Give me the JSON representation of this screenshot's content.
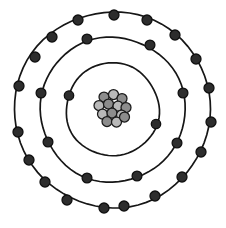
{
  "figure": {
    "name": "bohr-model-atom-diagram",
    "background_color": "#ffffff",
    "width": 226,
    "height": 228,
    "center": {
      "x": 112.5,
      "y": 109.5
    }
  },
  "colors": {
    "shell_stroke": "#161616",
    "electron_fill": "#2d2d2d",
    "electron_stroke": "#101010",
    "proton_fill": "#b9b9b9",
    "neutron_fill": "#8c8c8c",
    "nucleon_stroke": "#1a1a1a"
  },
  "nucleus": {
    "label": "nucleus",
    "nucleon_radius": 5.0,
    "nucleon_count": 13,
    "nucleons": [
      {
        "type": "neutron",
        "x": 104.0,
        "y": 97.0
      },
      {
        "type": "proton",
        "x": 113.5,
        "y": 94.5
      },
      {
        "type": "neutron",
        "x": 122.0,
        "y": 98.5
      },
      {
        "type": "proton",
        "x": 99.0,
        "y": 105.5
      },
      {
        "type": "neutron",
        "x": 108.5,
        "y": 104.0
      },
      {
        "type": "proton",
        "x": 118.0,
        "y": 106.0
      },
      {
        "type": "neutron",
        "x": 126.0,
        "y": 107.5
      },
      {
        "type": "proton",
        "x": 102.5,
        "y": 114.0
      },
      {
        "type": "neutron",
        "x": 112.0,
        "y": 113.0
      },
      {
        "type": "proton",
        "x": 121.5,
        "y": 115.0
      },
      {
        "type": "neutron",
        "x": 107.0,
        "y": 121.5
      },
      {
        "type": "proton",
        "x": 116.5,
        "y": 122.0
      },
      {
        "type": "neutron",
        "x": 124.5,
        "y": 117.0
      }
    ]
  },
  "shells": [
    {
      "name": "shell-1-inner",
      "index": 1,
      "radius": 46.5,
      "electron_count": 2,
      "electron_radius": 4.7,
      "electrons": [
        {
          "x": 69.0,
          "y": 95.5
        },
        {
          "x": 156.0,
          "y": 124.0
        }
      ]
    },
    {
      "name": "shell-2-middle",
      "index": 2,
      "radius": 72.5,
      "electron_count": 8,
      "electron_radius": 4.9,
      "electrons": [
        {
          "x": 150.0,
          "y": 45.0
        },
        {
          "x": 183.0,
          "y": 93.0
        },
        {
          "x": 177.0,
          "y": 143.0
        },
        {
          "x": 137.0,
          "y": 176.0
        },
        {
          "x": 87.0,
          "y": 178.0
        },
        {
          "x": 48.0,
          "y": 142.0
        },
        {
          "x": 41.0,
          "y": 93.0
        },
        {
          "x": 87.0,
          "y": 39.0
        }
      ]
    },
    {
      "name": "shell-3-outer",
      "index": 3,
      "radius": 98.0,
      "electron_count": 18,
      "electron_radius": 5.0,
      "electrons": [
        {
          "x": 114.0,
          "y": 15.0
        },
        {
          "x": 147.0,
          "y": 20.0
        },
        {
          "x": 175.0,
          "y": 35.0
        },
        {
          "x": 196.0,
          "y": 59.0
        },
        {
          "x": 209.0,
          "y": 88.0
        },
        {
          "x": 211.0,
          "y": 122.0
        },
        {
          "x": 201.0,
          "y": 152.0
        },
        {
          "x": 182.0,
          "y": 177.0
        },
        {
          "x": 155.0,
          "y": 196.0
        },
        {
          "x": 124.0,
          "y": 206.0
        },
        {
          "x": 104.0,
          "y": 208.0
        },
        {
          "x": 67.0,
          "y": 200.0
        },
        {
          "x": 45.0,
          "y": 182.0
        },
        {
          "x": 29.0,
          "y": 160.0
        },
        {
          "x": 18.0,
          "y": 132.0
        },
        {
          "x": 19.0,
          "y": 86.0
        },
        {
          "x": 35.0,
          "y": 57.0
        },
        {
          "x": 52.0,
          "y": 37.0
        },
        {
          "x": 78.0,
          "y": 20.0
        }
      ]
    }
  ]
}
